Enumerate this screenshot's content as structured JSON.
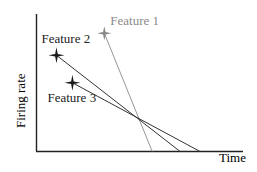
{
  "diagram": {
    "axes": {
      "x_label": "Time",
      "y_label": "Firing rate"
    },
    "features": [
      {
        "name": "Feature 1",
        "color": "#8a8a8a",
        "start": [
          0.34,
          0.86
        ],
        "end": [
          0.58,
          0.0
        ]
      },
      {
        "name": "Feature 2",
        "color": "#333333",
        "start": [
          0.1,
          0.7
        ],
        "end": [
          0.72,
          0.0
        ]
      },
      {
        "name": "Feature 3",
        "color": "#333333",
        "start": [
          0.18,
          0.5
        ],
        "end": [
          0.82,
          0.0
        ]
      }
    ],
    "colors": {
      "axis": "#222222",
      "feature_dark": "#1a1a1a",
      "feature_light": "#8a8a8a"
    }
  }
}
